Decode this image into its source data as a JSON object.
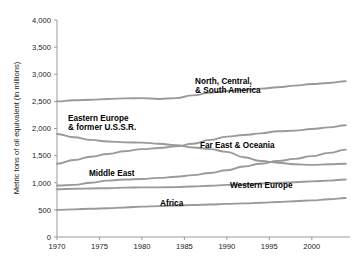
{
  "chart_data": {
    "type": "line",
    "title": "",
    "xlabel": "",
    "ylabel": "Metric tons of oil equivalent (in millions)",
    "xlim": [
      1970,
      2004
    ],
    "ylim": [
      0,
      4000
    ],
    "grid": false,
    "legend_position": "inline-labels",
    "x_ticks": [
      "1970",
      "1975",
      "1980",
      "1985",
      "1990",
      "1995",
      "2000"
    ],
    "x_tick_values": [
      1970,
      1975,
      1980,
      1985,
      1990,
      1995,
      2000
    ],
    "y_ticks": [
      "0",
      "500",
      "1,000",
      "1,500",
      "2,000",
      "2,500",
      "3,000",
      "3,500",
      "4,000"
    ],
    "y_tick_values": [
      0,
      500,
      1000,
      1500,
      2000,
      2500,
      3000,
      3500,
      4000
    ],
    "x": [
      1970,
      1972,
      1974,
      1976,
      1978,
      1980,
      1982,
      1984,
      1986,
      1988,
      1990,
      1992,
      1994,
      1996,
      1998,
      2000,
      2002,
      2004
    ],
    "series": [
      {
        "name": "North, Central, & South America",
        "label": "North, Central,\n& South America",
        "color": "#9a9a9a",
        "values": [
          2500,
          2520,
          2530,
          2545,
          2555,
          2560,
          2545,
          2560,
          2610,
          2660,
          2690,
          2710,
          2735,
          2760,
          2790,
          2820,
          2840,
          2870
        ]
      },
      {
        "name": "Eastern Europe & former U.S.S.R.",
        "label": "Eastern Europe\n& former U.S.S.R.",
        "color": "#9a9a9a",
        "values": [
          1900,
          1840,
          1790,
          1760,
          1745,
          1740,
          1720,
          1690,
          1650,
          1620,
          1570,
          1470,
          1400,
          1370,
          1340,
          1330,
          1340,
          1350
        ]
      },
      {
        "name": "Far East & Oceania",
        "label": "Far East & Oceania",
        "color": "#9a9a9a",
        "values": [
          1350,
          1420,
          1480,
          1530,
          1580,
          1620,
          1640,
          1670,
          1720,
          1790,
          1850,
          1880,
          1910,
          1950,
          1960,
          1990,
          2020,
          2060
        ]
      },
      {
        "name": "Middle East",
        "label": "Middle East",
        "color": "#9a9a9a",
        "values": [
          950,
          960,
          1000,
          1040,
          1060,
          1070,
          1090,
          1110,
          1140,
          1180,
          1230,
          1300,
          1350,
          1400,
          1440,
          1490,
          1550,
          1610
        ]
      },
      {
        "name": "Western Europe",
        "label": "Western Europe",
        "color": "#9a9a9a",
        "values": [
          880,
          890,
          895,
          900,
          910,
          915,
          915,
          920,
          930,
          945,
          960,
          970,
          985,
          1000,
          1010,
          1025,
          1040,
          1060
        ]
      },
      {
        "name": "Africa",
        "label": "Africa",
        "color": "#9a9a9a",
        "values": [
          500,
          510,
          520,
          530,
          545,
          560,
          570,
          580,
          590,
          600,
          610,
          620,
          630,
          645,
          660,
          675,
          695,
          720
        ]
      }
    ],
    "series_labels": [
      {
        "text_lines": [
          "North, Central,",
          "& South America"
        ],
        "x": 195,
        "y": 84
      },
      {
        "text_lines": [
          "Eastern Europe",
          "& former U.S.S.R."
        ],
        "x": 68,
        "y": 121
      },
      {
        "text_lines": [
          "Far East & Oceania"
        ],
        "x": 200,
        "y": 148
      },
      {
        "text_lines": [
          "Middle East"
        ],
        "x": 89,
        "y": 176
      },
      {
        "text_lines": [
          "Western Europe"
        ],
        "x": 230,
        "y": 188
      },
      {
        "text_lines": [
          "Africa"
        ],
        "x": 160,
        "y": 206
      }
    ],
    "colors": {
      "line": "#9a9a9a",
      "axis": "#9a9a9a",
      "text": "#1a1a1a",
      "label_text": "#000000",
      "background": "#ffffff"
    }
  }
}
